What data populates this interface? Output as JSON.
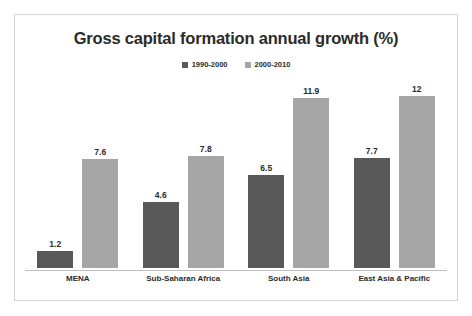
{
  "chart_data": {
    "type": "bar",
    "title": "Gross capital formation annual growth (%)",
    "xlabel": "",
    "ylabel": "",
    "ylim": [
      0,
      13.5
    ],
    "grid": false,
    "legend_position": "top-center",
    "categories": [
      "MENA",
      "Sub-Saharan Africa",
      "South Asia",
      "East Asia & Pacific"
    ],
    "series": [
      {
        "name": "1990-2000",
        "color": "#595959",
        "values": [
          1.2,
          4.6,
          6.5,
          7.7
        ],
        "labels": [
          "1.2",
          "4.6",
          "6.5",
          "7.7"
        ]
      },
      {
        "name": "2000-2010",
        "color": "#a6a6a6",
        "values": [
          7.6,
          7.8,
          11.9,
          12
        ],
        "labels": [
          "7.6",
          "7.8",
          "11.9",
          "12"
        ]
      }
    ]
  },
  "colors": {
    "series_1990_2000": "#595959",
    "series_2000_2010": "#a6a6a6",
    "frame_border": "#d4d4d4",
    "axis_line": "#bfbfbf",
    "text": "#2b2b2b",
    "background": "#ffffff"
  }
}
